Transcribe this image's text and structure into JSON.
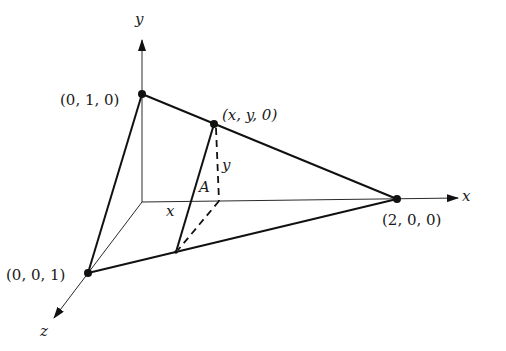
{
  "figure": {
    "axes": {
      "x_label": "x",
      "y_label": "y",
      "z_label": "z"
    },
    "vertices": {
      "v_y": {
        "label": "(0, 1, 0)"
      },
      "v_x": {
        "label": "(2, 0, 0)"
      },
      "v_z": {
        "label": "(0, 0, 1)"
      },
      "v_xy": {
        "label": "(x, y, 0)"
      }
    },
    "annotations": {
      "cross_section": "A",
      "height_label": "y",
      "x_position_label": "x"
    },
    "colors": {
      "background": "#ffffff",
      "ink": "#111111"
    }
  }
}
